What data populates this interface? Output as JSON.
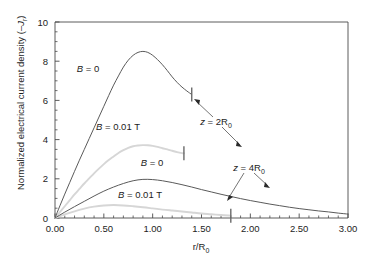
{
  "chart_data": {
    "type": "line",
    "title": "",
    "xlabel": "r/R0",
    "xlabel_parts": {
      "main": "r/R",
      "sub": "0"
    },
    "ylabel": "Normalized electrical current density (–Jr)",
    "ylabel_parts": {
      "main": "Normalized electrical current density (–",
      "italic": "J",
      "sub": "r",
      "tail": ")"
    },
    "xlim": [
      0.0,
      3.0
    ],
    "ylim": [
      0,
      10
    ],
    "xticks": [
      0.0,
      0.5,
      1.0,
      1.5,
      2.0,
      2.5,
      3.0
    ],
    "xticklabels": [
      "0.00",
      "0.50",
      "1.00",
      "1.50",
      "2.00",
      "2.50",
      "3.00"
    ],
    "yticks": [
      0,
      2,
      4,
      6,
      8,
      10
    ],
    "yticklabels": [
      "0",
      "2",
      "4",
      "6",
      "8",
      "10"
    ],
    "x_minor_step": 0.1,
    "y_minor_step": 0.5,
    "grid": false,
    "legend_position": "inline-labels",
    "colors": {
      "dark_curve": "#5a5a5a",
      "light_curve": "#d6d6d6",
      "axis": "#4a4a4a",
      "text": "#1d1d1d",
      "background": "#ffffff"
    },
    "series": [
      {
        "name": "z = 2R0, B = 0",
        "group": "z = 2R0",
        "field": "B = 0",
        "color": "#5a5a5a",
        "style": "dark",
        "peak": {
          "x": 0.92,
          "y": 8.5
        },
        "endpoint": {
          "x": 1.4,
          "y": 6.3
        },
        "x": [
          0.0,
          0.05,
          0.1,
          0.15,
          0.2,
          0.25,
          0.3,
          0.35,
          0.4,
          0.45,
          0.5,
          0.55,
          0.6,
          0.65,
          0.7,
          0.75,
          0.8,
          0.85,
          0.9,
          0.95,
          1.0,
          1.05,
          1.1,
          1.15,
          1.2,
          1.25,
          1.3,
          1.35,
          1.4
        ],
        "y": [
          0.0,
          0.62,
          1.22,
          1.8,
          2.38,
          2.95,
          3.5,
          4.05,
          4.6,
          5.15,
          5.7,
          6.25,
          6.78,
          7.25,
          7.7,
          8.05,
          8.3,
          8.45,
          8.5,
          8.45,
          8.3,
          8.08,
          7.82,
          7.52,
          7.2,
          6.92,
          6.68,
          6.48,
          6.3
        ]
      },
      {
        "name": "z = 2R0, B = 0.01 T",
        "group": "z = 2R0",
        "field": "B = 0.01 T",
        "color": "#d6d6d6",
        "style": "light",
        "peak": {
          "x": 0.92,
          "y": 3.72
        },
        "endpoint": {
          "x": 1.32,
          "y": 3.3
        },
        "x": [
          0.0,
          0.05,
          0.1,
          0.15,
          0.2,
          0.25,
          0.3,
          0.35,
          0.4,
          0.45,
          0.5,
          0.55,
          0.6,
          0.65,
          0.7,
          0.75,
          0.8,
          0.85,
          0.9,
          0.95,
          1.0,
          1.05,
          1.1,
          1.15,
          1.2,
          1.25,
          1.3,
          1.32
        ],
        "y": [
          0.0,
          0.3,
          0.6,
          0.9,
          1.2,
          1.48,
          1.76,
          2.02,
          2.28,
          2.52,
          2.75,
          2.96,
          3.14,
          3.32,
          3.46,
          3.58,
          3.66,
          3.7,
          3.72,
          3.71,
          3.68,
          3.63,
          3.56,
          3.5,
          3.43,
          3.36,
          3.31,
          3.3
        ]
      },
      {
        "name": "z = 4R0, B = 0",
        "group": "z = 4R0",
        "field": "B = 0",
        "color": "#5a5a5a",
        "style": "dark",
        "peak": {
          "x": 0.9,
          "y": 1.97
        },
        "endpoint": {
          "x": 3.0,
          "y": 0.2
        },
        "x": [
          0.0,
          0.1,
          0.2,
          0.3,
          0.4,
          0.5,
          0.6,
          0.7,
          0.8,
          0.9,
          1.0,
          1.1,
          1.2,
          1.3,
          1.4,
          1.5,
          1.6,
          1.7,
          1.8,
          1.9,
          2.0,
          2.1,
          2.2,
          2.3,
          2.4,
          2.5,
          2.6,
          2.7,
          2.8,
          2.9,
          3.0
        ],
        "y": [
          0.0,
          0.3,
          0.58,
          0.85,
          1.12,
          1.37,
          1.58,
          1.76,
          1.9,
          1.97,
          1.96,
          1.9,
          1.81,
          1.7,
          1.58,
          1.45,
          1.33,
          1.21,
          1.1,
          0.99,
          0.89,
          0.8,
          0.71,
          0.63,
          0.55,
          0.48,
          0.42,
          0.36,
          0.31,
          0.25,
          0.2
        ]
      },
      {
        "name": "z = 4R0, B = 0.01 T",
        "group": "z = 4R0",
        "field": "B = 0.01 T",
        "color": "#d6d6d6",
        "style": "light",
        "peak": {
          "x": 0.58,
          "y": 0.66
        },
        "endpoint": {
          "x": 1.8,
          "y": 0.12
        },
        "x": [
          0.0,
          0.1,
          0.2,
          0.3,
          0.4,
          0.5,
          0.6,
          0.7,
          0.8,
          0.9,
          1.0,
          1.1,
          1.2,
          1.3,
          1.4,
          1.5,
          1.6,
          1.7,
          1.8
        ],
        "y": [
          0.0,
          0.18,
          0.34,
          0.48,
          0.58,
          0.64,
          0.66,
          0.64,
          0.6,
          0.55,
          0.49,
          0.43,
          0.38,
          0.33,
          0.28,
          0.23,
          0.19,
          0.15,
          0.12
        ]
      }
    ],
    "annotations": [
      {
        "id": "label-b0-upper",
        "text": "B = 0",
        "italic_prefix": "B",
        "rest": " = 0",
        "x_px": 88,
        "y_px": 72
      },
      {
        "id": "label-b001-upper",
        "text": "B = 0.01 T",
        "italic_prefix": "B",
        "rest": " = 0.01 T",
        "x_px": 118,
        "y_px": 130
      },
      {
        "id": "label-b0-lower",
        "text": "B = 0",
        "italic_prefix": "B",
        "rest": " = 0",
        "x_px": 152,
        "y_px": 166
      },
      {
        "id": "label-b001-lower",
        "text": "B = 0.01 T",
        "italic_prefix": "B",
        "rest": " = 0.01 T",
        "x_px": 140,
        "y_px": 198
      },
      {
        "id": "annot-z-2r0",
        "text": "z = 2R0",
        "italic_prefix": "z",
        "rest": " = 2R",
        "sub": "0",
        "x_px": 216,
        "y_px": 122
      },
      {
        "id": "annot-z-4r0",
        "text": "z = 4R0",
        "italic_prefix": "z",
        "rest": " = 4R",
        "sub": "0",
        "x_px": 240,
        "y_px": 168
      }
    ]
  }
}
